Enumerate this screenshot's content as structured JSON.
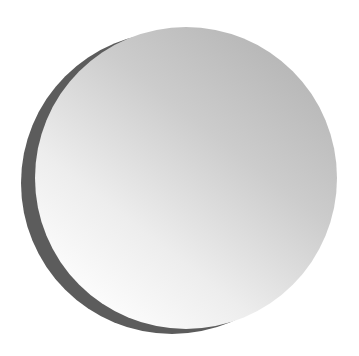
{
  "caption": {
    "text": "",
    "note": "cropped text at top edge, illegible"
  },
  "figure": {
    "colors": {
      "background": "#ffffff",
      "shadow_crescent": "#5a5a5a",
      "sphere_dark": "#b8b8b8",
      "sphere_light": "#f6f6f6"
    }
  }
}
